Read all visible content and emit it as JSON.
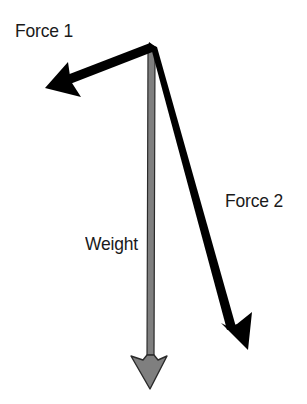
{
  "diagram": {
    "type": "free-body force diagram",
    "origin": {
      "x": 152,
      "y": 48
    },
    "colors": {
      "force_arrows": "#000000",
      "weight_fill": "#7f7f7f",
      "weight_outline": "#2a2a2a",
      "label_text": "#1a1a1a",
      "background": "#ffffff"
    },
    "vectors": [
      {
        "id": "force1",
        "label": "Force 1",
        "color": "#000000",
        "tip": {
          "x": 45,
          "y": 88
        }
      },
      {
        "id": "force2",
        "label": "Force 2",
        "color": "#000000",
        "tip": {
          "x": 248,
          "y": 350
        }
      },
      {
        "id": "weight",
        "label": "Weight",
        "color": "#7f7f7f",
        "tip": {
          "x": 150,
          "y": 388
        }
      }
    ]
  },
  "labels": {
    "force1": "Force 1",
    "force2": "Force 2",
    "weight": "Weight"
  }
}
